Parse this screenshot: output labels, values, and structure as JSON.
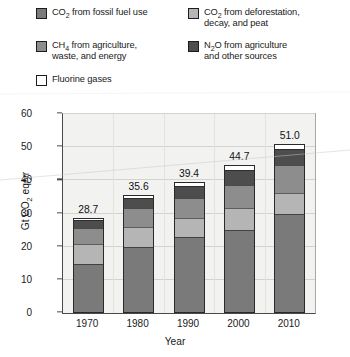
{
  "legend": {
    "items": [
      {
        "id": "co2-fossil",
        "label": "CO2 from fossil fuel use",
        "html": "CO<sub>2</sub> from fossil fuel use",
        "color": "#7a7a7a"
      },
      {
        "id": "co2-deforestation",
        "label": "CO2 from deforestation, decay, and peat",
        "html": "CO<sub>2</sub> from deforestation,\ndecay, and peat",
        "color": "#b5b5b5"
      },
      {
        "id": "ch4",
        "label": "CH4 from agriculture, waste, and energy",
        "html": "CH<sub>4</sub> from agriculture,\nwaste, and energy",
        "color": "#8d8d8d"
      },
      {
        "id": "n2o",
        "label": "N2O from agriculture and other sources",
        "html": "N<sub>2</sub>O from agriculture\nand other sources",
        "color": "#4d4d4d"
      },
      {
        "id": "fluorine",
        "label": "Fluorine gases",
        "html": "Fluorine gases",
        "color": "#ffffff"
      }
    ]
  },
  "chart_data": {
    "type": "bar",
    "subtype": "stacked",
    "title": "",
    "xlabel": "Year",
    "ylabel": "Gt CO2 eq/yr",
    "ylabel_html": "Gt CO<sub>2</sub> eq/yr",
    "categories": [
      "1970",
      "1980",
      "1990",
      "2000",
      "2010"
    ],
    "ylim": [
      0,
      60
    ],
    "yticks": [
      0,
      10,
      20,
      30,
      40,
      50,
      60
    ],
    "grid": true,
    "legend_position": "top",
    "totals": [
      28.7,
      35.6,
      39.4,
      44.7,
      51.0
    ],
    "total_labels": [
      "28.7",
      "35.6",
      "39.4",
      "44.7",
      "51.0"
    ],
    "series": [
      {
        "name": "CO2 from fossil fuel use",
        "color": "#7a7a7a",
        "values": [
          14.8,
          20.0,
          23.0,
          25.0,
          30.0
        ]
      },
      {
        "name": "CO2 from deforestation, decay, and peat",
        "color": "#b5b5b5",
        "values": [
          6.0,
          6.0,
          5.6,
          6.6,
          6.3
        ]
      },
      {
        "name": "CH4 from agriculture, waste, and energy",
        "color": "#8d8d8d",
        "values": [
          4.8,
          5.6,
          6.0,
          7.0,
          8.2
        ]
      },
      {
        "name": "N2O from agriculture and other sources",
        "color": "#4d4d4d",
        "values": [
          2.6,
          3.2,
          3.8,
          4.4,
          5.0
        ]
      },
      {
        "name": "Fluorine gases",
        "color": "#ffffff",
        "values": [
          0.5,
          0.8,
          1.0,
          1.7,
          1.5
        ]
      }
    ]
  }
}
